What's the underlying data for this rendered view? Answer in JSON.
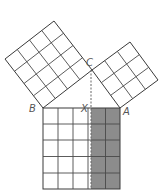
{
  "colors": {
    "shaded": "#8c8c8c",
    "line": "#444444",
    "dashed": "#666666",
    "label": "#555555",
    "background": "#ffffff"
  },
  "points": {
    "A": {
      "label": "A",
      "x": 120,
      "y": 108
    },
    "B": {
      "label": "B",
      "x": 43,
      "y": 108
    },
    "C": {
      "label": "C",
      "x": 92,
      "y": 70
    },
    "X": {
      "label": "X",
      "x": 91,
      "y": 108
    }
  },
  "labels": {
    "A": "A",
    "B": "B",
    "C": "C",
    "X": "X"
  },
  "squares": [
    {
      "name": "square-on-BC",
      "side_units": 4,
      "shaded": false
    },
    {
      "name": "square-on-CA",
      "side_units": 3,
      "shaded": true
    },
    {
      "name": "square-on-AB",
      "side_units": 5,
      "shaded_columns_right": 2,
      "unshaded_columns_left": 3
    }
  ]
}
